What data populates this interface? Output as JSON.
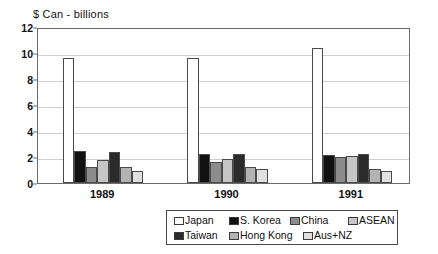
{
  "chart_data": {
    "type": "bar",
    "title": "$ Can  - billions",
    "xlabel": "",
    "ylabel": "",
    "ylim": [
      0,
      12
    ],
    "yticks": [
      0,
      2,
      4,
      6,
      8,
      10,
      12
    ],
    "grid": true,
    "legend_position": "bottom",
    "categories": [
      "1989",
      "1990",
      "1991"
    ],
    "series": [
      {
        "name": "Japan",
        "color": "#ffffff",
        "values": [
          9.6,
          9.6,
          10.4
        ]
      },
      {
        "name": "S. Korea",
        "color": "#111111",
        "values": [
          2.45,
          2.2,
          2.15
        ]
      },
      {
        "name": "China",
        "color": "#8c8c8c",
        "values": [
          1.25,
          1.6,
          2.0
        ]
      },
      {
        "name": "ASEAN",
        "color": "#c6c6c6",
        "values": [
          1.8,
          1.85,
          2.05
        ]
      },
      {
        "name": "Taiwan",
        "color": "#2b2b2b",
        "values": [
          2.4,
          2.25,
          2.2
        ]
      },
      {
        "name": "Hong Kong",
        "color": "#b3b3b3",
        "values": [
          1.25,
          1.2,
          1.1
        ]
      },
      {
        "name": "Aus+NZ",
        "color": "#e0e0e0",
        "values": [
          0.95,
          1.1,
          0.95
        ]
      }
    ]
  },
  "legend": {
    "rows": [
      [
        "Japan",
        "S. Korea",
        "China",
        "ASEAN"
      ],
      [
        "Taiwan",
        "Hong Kong",
        "Aus+NZ"
      ]
    ]
  }
}
